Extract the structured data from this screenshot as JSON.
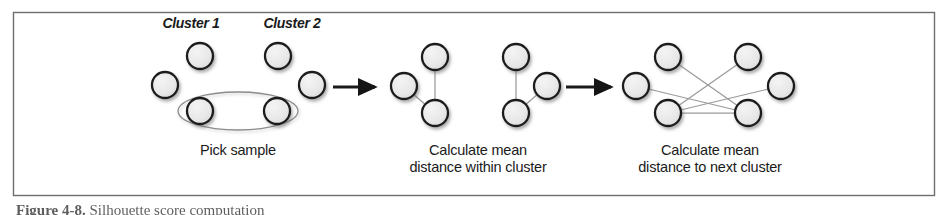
{
  "figure": {
    "frame": {
      "x": 13,
      "y": 12,
      "width": 922,
      "height": 184,
      "border_color": "#6e6e6e"
    },
    "caption": {
      "label": "Figure 4-8.",
      "text": "Silhouette score computation"
    },
    "colors": {
      "node_fill": "#e9e9e9",
      "node_stroke": "#1d1d1d",
      "edge": "#9a9a9a",
      "arrow": "#1a1a1a",
      "ellipse": "#8d8d8d",
      "text": "#1b1b1b",
      "background": "#ffffff"
    },
    "panels": [
      {
        "id": "panel-pick-sample",
        "caption": "Pick sample",
        "caption_x": 238,
        "caption_y": 155,
        "cluster_labels": [
          {
            "text": "Cluster 1",
            "x": 191,
            "y": 28
          },
          {
            "text": "Cluster 2",
            "x": 292,
            "y": 28
          }
        ],
        "nodes": [
          {
            "id": "c1-top",
            "cx": 200,
            "cy": 56
          },
          {
            "id": "c1-left",
            "cx": 165,
            "cy": 85
          },
          {
            "id": "c1-bottom",
            "cx": 200,
            "cy": 111
          },
          {
            "id": "c2-top",
            "cx": 278,
            "cy": 56
          },
          {
            "id": "c2-right",
            "cx": 312,
            "cy": 85
          },
          {
            "id": "c2-bottom",
            "cx": 277,
            "cy": 111
          }
        ],
        "edges": [],
        "ellipse": {
          "cx": 238,
          "cy": 111,
          "rx": 60,
          "ry": 19
        }
      },
      {
        "id": "panel-within-cluster",
        "caption_lines": [
          "Calculate mean",
          "distance within cluster"
        ],
        "caption_x": 478,
        "caption_y": 155,
        "cluster_labels": [],
        "nodes": [
          {
            "id": "a-top",
            "cx": 435,
            "cy": 57
          },
          {
            "id": "a-left",
            "cx": 404,
            "cy": 86
          },
          {
            "id": "a-bottom",
            "cx": 435,
            "cy": 113
          },
          {
            "id": "b-top",
            "cx": 516,
            "cy": 57
          },
          {
            "id": "b-right",
            "cx": 547,
            "cy": 86
          },
          {
            "id": "b-bottom",
            "cx": 516,
            "cy": 113
          }
        ],
        "edges": [
          {
            "from": "a-top",
            "to": "a-bottom"
          },
          {
            "from": "a-left",
            "to": "a-bottom"
          },
          {
            "from": "b-top",
            "to": "b-bottom"
          },
          {
            "from": "b-bottom",
            "to": "b-right"
          }
        ],
        "ellipse": null
      },
      {
        "id": "panel-next-cluster",
        "caption_lines": [
          "Calculate mean",
          "distance to next cluster"
        ],
        "caption_x": 710,
        "caption_y": 155,
        "cluster_labels": [],
        "nodes": [
          {
            "id": "l-top",
            "cx": 668,
            "cy": 57
          },
          {
            "id": "l-left",
            "cx": 636,
            "cy": 86
          },
          {
            "id": "l-bottom",
            "cx": 668,
            "cy": 113
          },
          {
            "id": "r-top",
            "cx": 748,
            "cy": 57
          },
          {
            "id": "r-right",
            "cx": 781,
            "cy": 86
          },
          {
            "id": "r-bottom",
            "cx": 748,
            "cy": 113
          }
        ],
        "edges": [
          {
            "from": "l-top",
            "to": "r-bottom"
          },
          {
            "from": "l-left",
            "to": "r-bottom"
          },
          {
            "from": "l-bottom",
            "to": "r-top"
          },
          {
            "from": "l-bottom",
            "to": "r-right"
          },
          {
            "from": "l-bottom",
            "to": "r-bottom"
          }
        ],
        "ellipse": null
      }
    ],
    "arrows": [
      {
        "id": "arrow-1",
        "x1": 333,
        "y1": 87,
        "x2": 375,
        "y2": 87
      },
      {
        "id": "arrow-2",
        "x1": 566,
        "y1": 87,
        "x2": 611,
        "y2": 87
      }
    ],
    "node_radius": 13
  }
}
